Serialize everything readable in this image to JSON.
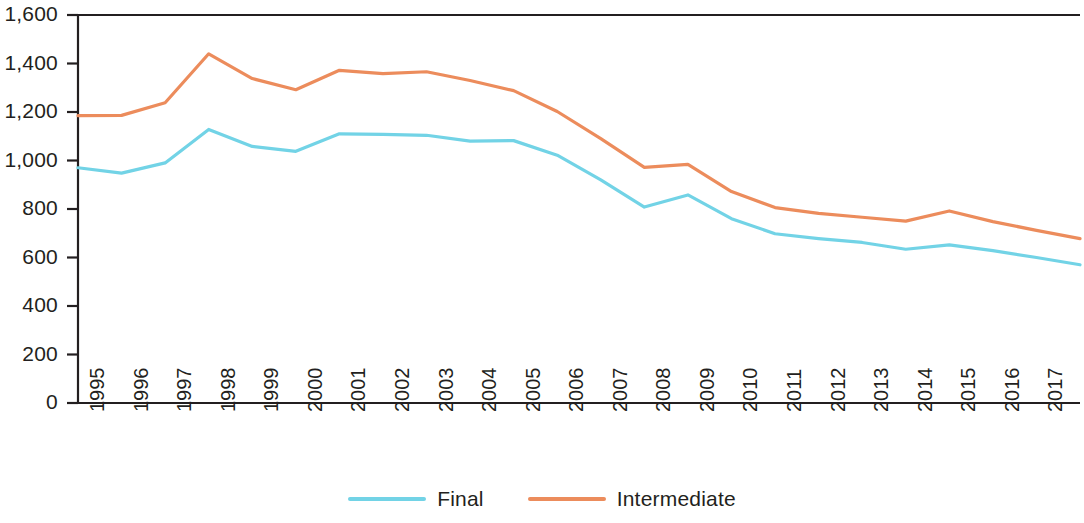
{
  "chart_data": {
    "type": "line",
    "title": "",
    "subtitle": "",
    "xlabel": "",
    "ylabel": "",
    "categories": [
      "1995",
      "1996",
      "1997",
      "1998",
      "1999",
      "2000",
      "2001",
      "2002",
      "2003",
      "2004",
      "2005",
      "2006",
      "2007",
      "2008",
      "2009",
      "2010",
      "2011",
      "2012",
      "2013",
      "2014",
      "2015",
      "2016",
      "2017",
      "2018"
    ],
    "series": [
      {
        "name": "Final",
        "color": "#72d3e6",
        "values": [
          970,
          948,
          990,
          1128,
          1058,
          1038,
          1110,
          1108,
          1104,
          1080,
          1082,
          1022,
          920,
          808,
          858,
          760,
          698,
          678,
          662,
          634,
          652,
          628,
          600,
          570
        ]
      },
      {
        "name": "Intermediate",
        "color": "#ec8c5c",
        "values": [
          1185,
          1186,
          1238,
          1440,
          1338,
          1292,
          1372,
          1358,
          1366,
          1330,
          1288,
          1202,
          1090,
          972,
          984,
          872,
          806,
          782,
          766,
          750,
          792,
          748,
          712,
          678
        ]
      }
    ],
    "ylim": [
      0,
      1600
    ],
    "y_ticks": [
      "0",
      "200",
      "400",
      "600",
      "800",
      "1,000",
      "1,200",
      "1,400",
      "1,600"
    ],
    "y_tick_values": [
      0,
      200,
      400,
      600,
      800,
      1000,
      1200,
      1400,
      1600
    ],
    "grid": false,
    "legend_position": "bottom",
    "axis_color": "#231f20"
  },
  "legend": {
    "items": [
      {
        "label": "Final",
        "color": "#72d3e6"
      },
      {
        "label": "Intermediate",
        "color": "#ec8c5c"
      }
    ]
  }
}
